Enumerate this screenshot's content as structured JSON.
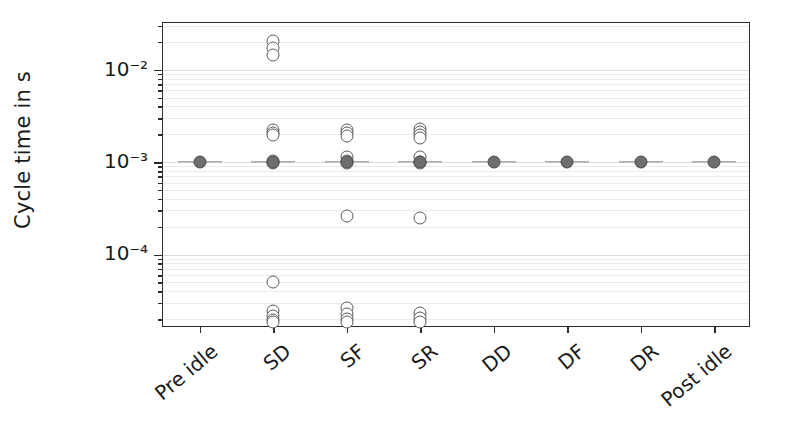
{
  "axes": {
    "ylabel": "Cycle time in s",
    "xlabel": "",
    "ytick_labels": [
      "10⁻²",
      "10⁻³",
      "10⁻⁴"
    ],
    "ytick_values": [
      0.01,
      0.001,
      0.0001
    ]
  },
  "chart_data": {
    "type": "scatter",
    "title": "",
    "xlabel": "",
    "ylabel": "Cycle time in s",
    "yscale": "log",
    "ylim": [
      1.6e-05,
      0.032
    ],
    "grid": true,
    "legend": "none",
    "categories": [
      "Pre idle",
      "SD",
      "SF",
      "SR",
      "DD",
      "DF",
      "DR",
      "Post idle"
    ],
    "marker_styles": {
      "median": "filled-grey-circle",
      "outlier": "open-circle",
      "whisker": "horizontal-grey-line"
    },
    "series": [
      {
        "name": "Pre idle",
        "median": 0.001,
        "whisker_low": 0.001,
        "whisker_high": 0.001,
        "outliers": []
      },
      {
        "name": "SD",
        "median": 0.001,
        "whisker_low": 0.00095,
        "whisker_high": 0.00105,
        "outliers": [
          0.0205,
          0.0172,
          0.0145,
          0.00225,
          0.00205,
          0.00195,
          0.00102,
          0.00098,
          5e-05,
          2.45e-05,
          2.15e-05,
          1.95e-05,
          1.85e-05
        ]
      },
      {
        "name": "SF",
        "median": 0.001,
        "whisker_low": 0.00095,
        "whisker_high": 0.00105,
        "outliers": [
          0.00225,
          0.00205,
          0.00192,
          0.00115,
          0.00102,
          0.00098,
          0.00026,
          2.65e-05,
          2.25e-05,
          1.98e-05,
          1.86e-05
        ]
      },
      {
        "name": "SR",
        "median": 0.001,
        "whisker_low": 0.00095,
        "whisker_high": 0.00105,
        "outliers": [
          0.0023,
          0.00212,
          0.00196,
          0.00183,
          0.00114,
          0.00101,
          0.00097,
          0.00025,
          2.32e-05,
          2.05e-05,
          1.88e-05
        ]
      },
      {
        "name": "DD",
        "median": 0.001,
        "whisker_low": 0.00098,
        "whisker_high": 0.00102,
        "outliers": []
      },
      {
        "name": "DF",
        "median": 0.001,
        "whisker_low": 0.00098,
        "whisker_high": 0.00102,
        "outliers": []
      },
      {
        "name": "DR",
        "median": 0.001,
        "whisker_low": 0.00098,
        "whisker_high": 0.00102,
        "outliers": []
      },
      {
        "name": "Post idle",
        "median": 0.001,
        "whisker_low": 0.001,
        "whisker_high": 0.001,
        "outliers": []
      }
    ]
  },
  "style": {
    "marker_fill": "#6e6e6e",
    "marker_edge": "#4a4a4a",
    "outlier_edge": "#5a5a5a",
    "grid_color": "#d9d9d9",
    "axis_color": "#2b2b2b",
    "text_color": "#1a1a1a",
    "background": "#ffffff"
  }
}
